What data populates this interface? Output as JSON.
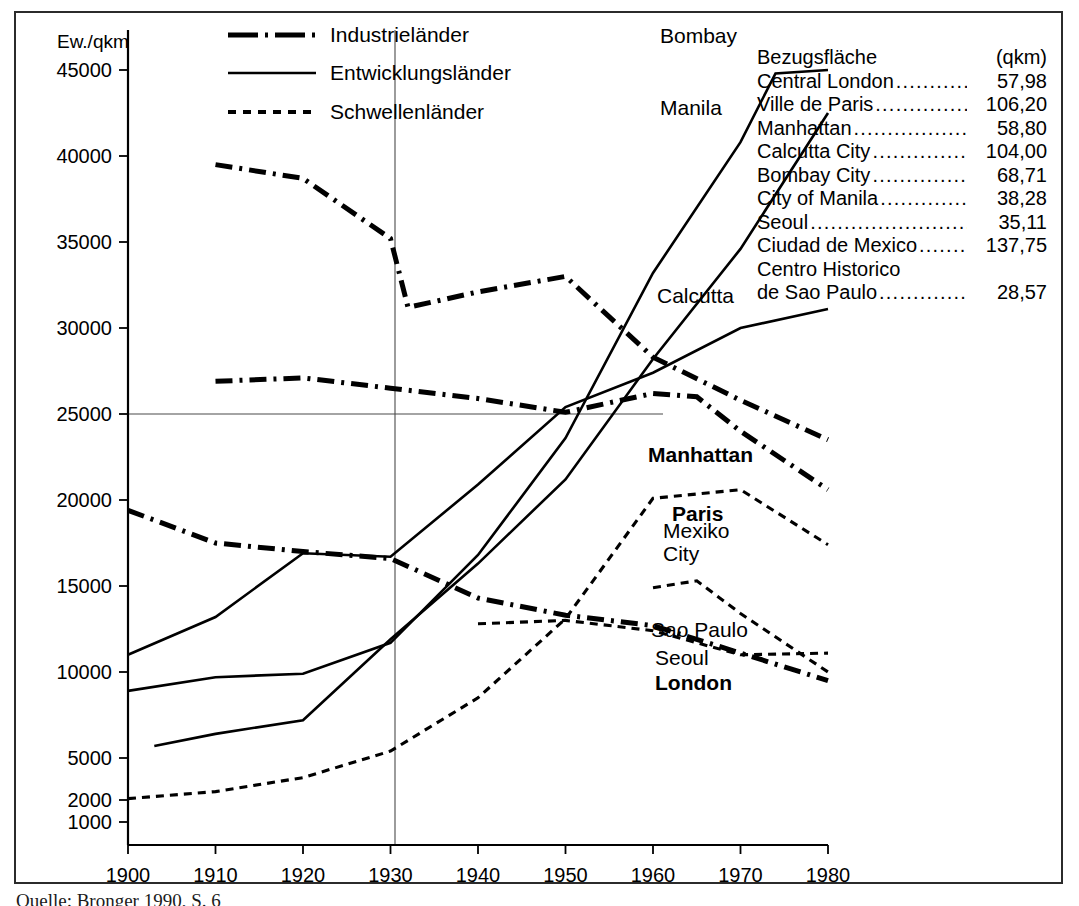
{
  "figure": {
    "y_axis_title": "Ew./qkm",
    "caption": "Quelle: Bronger 1990, S. 6"
  },
  "legend": {
    "position": "top-left-inside",
    "items": [
      {
        "label": "Industrieländer",
        "style": "dash-dot-bold"
      },
      {
        "label": "Entwicklungsländer",
        "style": "solid"
      },
      {
        "label": "Schwellenländer",
        "style": "dotted"
      }
    ]
  },
  "side_table": {
    "title": "Bezugsfläche",
    "unit_header": "(qkm)",
    "rows": [
      {
        "name": "Central London",
        "value": "57,98"
      },
      {
        "name": "Ville de Paris",
        "value": "106,20"
      },
      {
        "name": "Manhattan",
        "value": "58,80"
      },
      {
        "name": "Calcutta City",
        "value": "104,00"
      },
      {
        "name": "Bombay City",
        "value": "68,71"
      },
      {
        "name": "City of Manila",
        "value": "38,28"
      },
      {
        "name": "Seoul",
        "value": "35,11"
      },
      {
        "name": "Ciudad de Mexico",
        "value": "137,75"
      },
      {
        "name": "Centro Historico",
        "value": ""
      },
      {
        "name": "de Sao Paulo",
        "value": "28,57"
      }
    ]
  },
  "chart_data": {
    "type": "line",
    "title": "",
    "xlabel": "",
    "ylabel": "Ew./qkm",
    "xlim": [
      1900,
      1980
    ],
    "ylim": [
      0,
      47000
    ],
    "grid": false,
    "x_ticks": [
      1900,
      1910,
      1920,
      1930,
      1940,
      1950,
      1960,
      1970,
      1980
    ],
    "y_ticks": [
      1000,
      2000,
      5000,
      10000,
      15000,
      20000,
      25000,
      30000,
      35000,
      40000,
      45000
    ],
    "reference_lines": [
      {
        "axis": "x",
        "value": 1940
      },
      {
        "axis": "y",
        "value": 25000
      }
    ],
    "series": [
      {
        "name": "Bombay",
        "group": "Entwicklungsländer",
        "style": "solid",
        "label_bold": false,
        "x": [
          1900,
          1910,
          1920,
          1930,
          1940,
          1950,
          1960,
          1970,
          1974,
          1980
        ],
        "y": [
          8900,
          9700,
          9900,
          11700,
          16800,
          23600,
          33200,
          40800,
          44800,
          46200
        ]
      },
      {
        "name": "Manila",
        "group": "Entwicklungsländer",
        "style": "solid",
        "label_bold": false,
        "x": [
          1903,
          1910,
          1920,
          1930,
          1940,
          1950,
          1960,
          1970,
          1980
        ],
        "y": [
          5700,
          6400,
          7200,
          11900,
          16300,
          21200,
          28200,
          34600,
          42500
        ]
      },
      {
        "name": "Calcutta",
        "group": "Entwicklungsländer",
        "style": "solid",
        "label_bold": false,
        "x": [
          1900,
          1910,
          1920,
          1930,
          1940,
          1950,
          1960,
          1970,
          1980
        ],
        "y": [
          11000,
          13200,
          16900,
          16700,
          20900,
          25400,
          27400,
          30000,
          31100
        ]
      },
      {
        "name": "Manhattan",
        "group": "Industrieländer",
        "style": "dash-dot-bold",
        "label_bold": true,
        "x": [
          1910,
          1920,
          1930,
          1932,
          1940,
          1950,
          1960,
          1970,
          1980
        ],
        "y": [
          39500,
          38700,
          35200,
          31200,
          32100,
          33000,
          28300,
          25800,
          23500
        ]
      },
      {
        "name": "Paris",
        "group": "Industrieländer",
        "style": "dash-dot-bold",
        "label_bold": true,
        "x": [
          1910,
          1920,
          1930,
          1940,
          1950,
          1960,
          1965,
          1970,
          1980
        ],
        "y": [
          26900,
          27100,
          26500,
          25900,
          25100,
          26200,
          26000,
          24000,
          20600
        ]
      },
      {
        "name": "London",
        "group": "Industrieländer",
        "style": "dash-dot-bold",
        "label_bold": true,
        "x": [
          1900,
          1910,
          1920,
          1930,
          1940,
          1950,
          1960,
          1970,
          1980
        ],
        "y": [
          19400,
          17500,
          17000,
          16600,
          14300,
          13300,
          12700,
          11100,
          9500
        ]
      },
      {
        "name": "Mexiko City",
        "group": "Schwellenländer",
        "style": "dotted",
        "label_bold": false,
        "x": [
          1900,
          1910,
          1920,
          1930,
          1940,
          1950,
          1960,
          1970,
          1980
        ],
        "y": [
          2100,
          2600,
          3600,
          5400,
          8500,
          13100,
          20100,
          20600,
          17400
        ]
      },
      {
        "name": "Sao Paulo",
        "group": "Schwellenländer",
        "style": "dotted",
        "label_bold": false,
        "x": [
          1940,
          1950,
          1960,
          1970,
          1980
        ],
        "y": [
          12800,
          13000,
          12400,
          11000,
          11100
        ]
      },
      {
        "name": "Seoul",
        "group": "Schwellenländer",
        "style": "dotted",
        "label_bold": false,
        "x": [
          1960,
          1965,
          1970,
          1980
        ],
        "y": [
          14900,
          15300,
          13400,
          10000
        ]
      }
    ],
    "series_labels": [
      {
        "text": "Bombay",
        "x_px": 660,
        "y_px": 43,
        "bold": false
      },
      {
        "text": "Manila",
        "x_px": 660,
        "y_px": 115,
        "bold": false
      },
      {
        "text": "Calcutta",
        "x_px": 657,
        "y_px": 303,
        "bold": false
      },
      {
        "text": "Manhattan",
        "x_px": 648,
        "y_px": 462,
        "bold": true
      },
      {
        "text": "Paris",
        "x_px": 672,
        "y_px": 521,
        "bold": true
      },
      {
        "text": "Mexiko",
        "x_px": 663,
        "y_px": 538,
        "bold": false
      },
      {
        "text": "City",
        "x_px": 663,
        "y_px": 561,
        "bold": false
      },
      {
        "text": "Sao Paulo",
        "x_px": 651,
        "y_px": 637,
        "bold": false
      },
      {
        "text": "Seoul",
        "x_px": 655,
        "y_px": 665,
        "bold": false
      },
      {
        "text": "London",
        "x_px": 655,
        "y_px": 690,
        "bold": true
      }
    ]
  }
}
